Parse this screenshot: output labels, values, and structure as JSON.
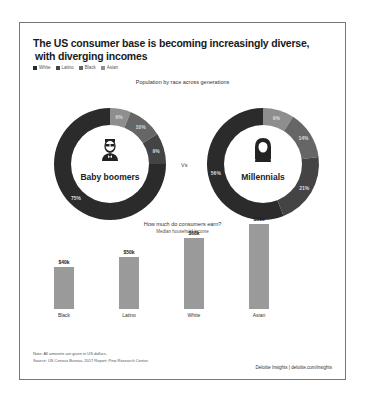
{
  "title_line1": "The US consumer base is becoming increasingly diverse,",
  "title_line2": "with diverging incomes",
  "legend": [
    {
      "label": "White",
      "color": "#2b2b2b"
    },
    {
      "label": "Latino",
      "color": "#444444"
    },
    {
      "label": "Black",
      "color": "#666666"
    },
    {
      "label": "Asian",
      "color": "#8e8e8e"
    }
  ],
  "population_subtitle": "Population by race across generations",
  "vs_label": "Vs",
  "bar_title": "How much do consumers earn?",
  "bar_subtitle": "Median household income",
  "note": "Note: All amounts are given in US dollars.",
  "source": "Source: US Census Bureau, 2017 Report; Pew Research Center.",
  "credit": "Deloitte Insights | deloitte.com/insights",
  "chart_data": [
    {
      "type": "pie",
      "title": "Baby boomers",
      "subtitle": "Population by race across generations",
      "categories": [
        "Asian",
        "Black",
        "Latino",
        "White"
      ],
      "values": [
        6,
        10,
        9,
        75
      ],
      "labels": [
        "6%",
        "10%",
        "9%",
        "75%"
      ],
      "colors": [
        "#8e8e8e",
        "#666666",
        "#444444",
        "#2b2b2b"
      ]
    },
    {
      "type": "pie",
      "title": "Millennials",
      "subtitle": "Population by race across generations",
      "categories": [
        "Asian",
        "Black",
        "Latino",
        "White"
      ],
      "values": [
        9,
        14,
        21,
        56
      ],
      "labels": [
        "9%",
        "14%",
        "21%",
        "56%"
      ],
      "colors": [
        "#8e8e8e",
        "#666666",
        "#444444",
        "#2b2b2b"
      ]
    },
    {
      "type": "bar",
      "title": "How much do consumers earn?",
      "subtitle": "Median household income",
      "categories": [
        "Black",
        "Latino",
        "White",
        "Asian"
      ],
      "values": [
        40,
        50,
        68,
        81
      ],
      "labels": [
        "$40k",
        "$50k",
        "$68k",
        "$81k"
      ],
      "xlabel": "",
      "ylabel": "Median household income ($k)",
      "ylim": [
        0,
        81
      ],
      "grid": false
    }
  ]
}
